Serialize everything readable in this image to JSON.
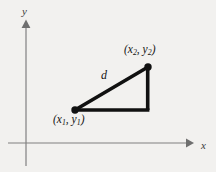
{
  "figure": {
    "name": "distance-formula-right-triangle",
    "background_color": "#f2f1ef",
    "axis_color": "#808080",
    "triangle_color": "#111111",
    "text_color": "#141414"
  },
  "axes": {
    "x_label": "x",
    "y_label": "y",
    "x_axis": {
      "x1": 8,
      "y1": 143,
      "x2": 186,
      "y2": 143
    },
    "y_axis": {
      "x1": 26,
      "y1": 22,
      "x2": 26,
      "y2": 166
    },
    "x_arrow_tip": {
      "x": 190,
      "y": 143
    },
    "y_arrow_tip": {
      "x": 26,
      "y": 20
    },
    "x_label_pos": {
      "x": 200,
      "y": 141
    },
    "y_label_pos": {
      "x": 22,
      "y": 8
    }
  },
  "triangle": {
    "vertex_lower_left": {
      "x": 75,
      "y": 110
    },
    "vertex_upper_right": {
      "x": 148,
      "y": 67
    },
    "vertex_right_angle": {
      "x": 148,
      "y": 110
    },
    "stroke_width": 3.6,
    "dot_radius": 3.6
  },
  "labels": {
    "point1": {
      "open": "(",
      "x_var": "x",
      "x_sub": "1",
      "comma": ", ",
      "y_var": "y",
      "y_sub": "1",
      "close": ")",
      "pos": {
        "x": 53,
        "y": 114
      }
    },
    "point2": {
      "open": "(",
      "x_var": "x",
      "x_sub": "2",
      "comma": ", ",
      "y_var": "y",
      "y_sub": "2",
      "close": ")",
      "pos": {
        "x": 124,
        "y": 44
      }
    },
    "distance": {
      "text": "d",
      "pos": {
        "x": 101,
        "y": 69
      }
    }
  }
}
